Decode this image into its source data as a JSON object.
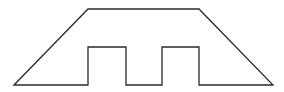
{
  "diagram": {
    "width": 284,
    "height": 92,
    "background": "#ffffff",
    "stroke": "#2a2a2a",
    "stroke_width": 1.3,
    "shape": {
      "name": "trapezoid-with-two-notches",
      "points": "14,85 88,9 199,9 273,85 199,85 199,47 162,47 162,85 126,85 126,47 88,47 88,85"
    }
  }
}
